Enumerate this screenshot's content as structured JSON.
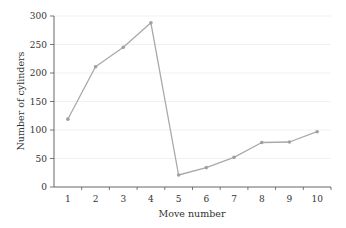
{
  "chart_data": {
    "type": "line",
    "title": "",
    "xlabel": "Move number",
    "ylabel": "Number of cylinders",
    "categories": [
      "1",
      "2",
      "3",
      "4",
      "5",
      "6",
      "7",
      "8",
      "9",
      "10"
    ],
    "series": [
      {
        "name": "Number of cylinders",
        "values": [
          119,
          211,
          245,
          288,
          21,
          34,
          52,
          78,
          79,
          97
        ]
      }
    ],
    "ylim": [
      0,
      300
    ],
    "yticks": [
      0,
      50,
      100,
      150,
      200,
      250,
      300
    ],
    "grid": true,
    "legend": "none",
    "colors": {
      "line": "#a9a9a9",
      "marker": "#a0a0a0",
      "axis": "#555555",
      "grid": "#f1f1f1"
    }
  }
}
